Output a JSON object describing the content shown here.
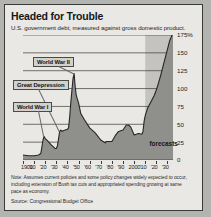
{
  "figure": {
    "title": "Headed for Trouble",
    "subtitle": "U.S. government debt, measured against gross domestic product.",
    "note": "Note: Assumes current policies and some policy changes widely expected to occur, including extension of Bush tax cuts and appropriated spending growing at same pace as economy.",
    "source": "Source: Congressional Budget Office",
    "forecast_label": "forecasts",
    "colors": {
      "panel_background": "#e9e8e4",
      "outer_background": "#b3b3b0",
      "area_fill": "#8f8f8c",
      "forecast_band": "#c4c3bf",
      "line": "#26262a",
      "gridline": "#3a3a38",
      "callout_fill": "#d2d1cc"
    }
  },
  "callouts": [
    {
      "label": "World War I",
      "year": 1919,
      "value": 33
    },
    {
      "label": "Great Depression",
      "year": 1933,
      "value": 40
    },
    {
      "label": "World War II",
      "year": 1946,
      "value": 121
    }
  ],
  "chart_data": {
    "type": "area",
    "title": "Headed for Trouble",
    "subtitle": "U.S. government debt, measured against gross domestic product.",
    "xlabel": "",
    "ylabel": "Percent of GDP",
    "xlim": [
      1900,
      2035
    ],
    "ylim": [
      0,
      175
    ],
    "yticks": [
      0,
      25,
      50,
      75,
      100,
      125,
      150,
      175
    ],
    "ytick_labels": [
      "0",
      "25",
      "50",
      "75",
      "100",
      "125",
      "150",
      "175%"
    ],
    "xticks": [
      1900,
      1910,
      1920,
      1930,
      1940,
      1950,
      1960,
      1970,
      1980,
      1990,
      2000,
      2010,
      2020,
      2030
    ],
    "xtick_labels": [
      "1900",
      "'10",
      "'20",
      "'30",
      "'40",
      "'50",
      "'60",
      "'70",
      "'80",
      "'90",
      "2000",
      "'10",
      "'20",
      "'30"
    ],
    "grid": "horizontal",
    "legend": "none",
    "forecast_start_year": 2010,
    "series": [
      {
        "name": "Federal debt held by the public (% of GDP)",
        "x": [
          1900,
          1905,
          1910,
          1914,
          1916,
          1917,
          1918,
          1919,
          1920,
          1922,
          1925,
          1929,
          1930,
          1931,
          1932,
          1933,
          1934,
          1935,
          1936,
          1938,
          1940,
          1941,
          1942,
          1943,
          1944,
          1945,
          1946,
          1947,
          1948,
          1950,
          1952,
          1955,
          1960,
          1965,
          1970,
          1974,
          1975,
          1980,
          1983,
          1986,
          1990,
          1993,
          1995,
          1997,
          2000,
          2004,
          2007,
          2008,
          2009,
          2010
        ],
        "y": [
          7,
          6,
          6,
          7,
          9,
          18,
          28,
          33,
          30,
          27,
          22,
          16,
          16,
          20,
          30,
          40,
          42,
          40,
          41,
          42,
          43,
          45,
          60,
          80,
          97,
          114,
          121,
          102,
          90,
          80,
          65,
          57,
          45,
          38,
          28,
          24,
          26,
          26,
          34,
          40,
          42,
          49,
          49,
          46,
          35,
          37,
          36,
          40,
          54,
          62
        ]
      },
      {
        "name": "Forecast",
        "x": [
          2010,
          2012,
          2014,
          2016,
          2018,
          2020,
          2022,
          2024,
          2026,
          2028,
          2030,
          2032,
          2035
        ],
        "y": [
          62,
          72,
          78,
          84,
          90,
          98,
          108,
          119,
          131,
          143,
          155,
          167,
          178
        ]
      }
    ]
  }
}
